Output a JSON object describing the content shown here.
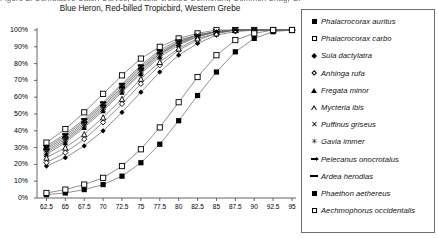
{
  "title": {
    "line1": "Figure 2. Cumulative Catch Curves, Double-crested Cormorant, Common Shag, Great White Pelican, Great",
    "line2": "Blue Heron, Red-billed Tropicbird, Western Grebe"
  },
  "legend": {
    "items": [
      {
        "marker": "filled-square",
        "label": "Phalacrocorax auritus"
      },
      {
        "marker": "open-square",
        "label": "Phalacrocorax carbo"
      },
      {
        "marker": "filled-diamond",
        "label": "Sula dactylatra"
      },
      {
        "marker": "open-diamond",
        "label": "Anhinga rufa"
      },
      {
        "marker": "filled-triangle",
        "label": "Fregata minor"
      },
      {
        "marker": "open-triangle",
        "label": "Mycteria ibis"
      },
      {
        "marker": "cross-x",
        "label": "Puffinus griseus"
      },
      {
        "marker": "asterisk",
        "label": "Gavia immer"
      },
      {
        "marker": "dash-arrow",
        "label": "Pelecanus onocrotalus"
      },
      {
        "marker": "dash",
        "label": "Ardea herodias"
      },
      {
        "marker": "filled-square",
        "label": "Phaethon aethereus"
      },
      {
        "marker": "open-square",
        "label": "Aechmophorus occidentalis"
      }
    ]
  },
  "chart_data": {
    "type": "line",
    "title": "Figure 2. Cumulative Catch Curves, Double-crested Cormorant, Common Shag, Great White Pelican, Great Blue Heron, Red-billed Tropicbird, Western Grebe",
    "xlabel": "",
    "ylabel": "",
    "grid": false,
    "legend_position": "right",
    "xlim": [
      61.25,
      95
    ],
    "ylim": [
      0,
      100
    ],
    "x": [
      62.5,
      65,
      67.5,
      70,
      72.5,
      75,
      77.5,
      80,
      82.5,
      85,
      87.5,
      90,
      92.5,
      95
    ],
    "xticks": [
      "62.5",
      "65",
      "67.5",
      "70",
      "72.5",
      "75",
      "77.5",
      "80",
      "82.5",
      "85",
      "87.5",
      "90",
      "92.5",
      "95"
    ],
    "yticks": [
      "0%",
      "10%",
      "20%",
      "30%",
      "40%",
      "50%",
      "60%",
      "70%",
      "80%",
      "90%",
      "100%"
    ],
    "series": [
      {
        "name": "Phalacrocorax auritus",
        "marker": "filled-square",
        "values": [
          30,
          37,
          46,
          56,
          67,
          78,
          87,
          93,
          97,
          99,
          100,
          100,
          100,
          100
        ]
      },
      {
        "name": "Phalacrocorax carbo",
        "marker": "open-square",
        "values": [
          33,
          41,
          51,
          62,
          73,
          83,
          90,
          95,
          98,
          100,
          100,
          100,
          100,
          100
        ]
      },
      {
        "name": "Sula dactylatra",
        "marker": "filled-diamond",
        "values": [
          19,
          24,
          31,
          40,
          51,
          63,
          75,
          85,
          92,
          97,
          99,
          100,
          100,
          100
        ]
      },
      {
        "name": "Anhinga rufa",
        "marker": "open-diamond",
        "values": [
          21,
          27,
          35,
          45,
          56,
          68,
          79,
          88,
          94,
          98,
          100,
          100,
          100,
          100
        ]
      },
      {
        "name": "Fregata minor",
        "marker": "filled-triangle",
        "values": [
          26,
          33,
          42,
          52,
          63,
          74,
          84,
          91,
          96,
          99,
          100,
          100,
          100,
          100
        ]
      },
      {
        "name": "Mycteria ibis",
        "marker": "open-triangle",
        "values": [
          24,
          30,
          38,
          48,
          59,
          71,
          81,
          89,
          95,
          98,
          100,
          100,
          100,
          100
        ]
      },
      {
        "name": "Puffinus griseus",
        "marker": "cross-x",
        "values": [
          27,
          34,
          43,
          53,
          64,
          75,
          85,
          92,
          96,
          99,
          100,
          100,
          100,
          100
        ]
      },
      {
        "name": "Gavia immer",
        "marker": "asterisk",
        "values": [
          28,
          35,
          44,
          54,
          65,
          76,
          86,
          92,
          97,
          99,
          100,
          100,
          100,
          100
        ]
      },
      {
        "name": "Pelecanus onocrotalus",
        "marker": "dash-arrow",
        "values": [
          29,
          36,
          45,
          55,
          66,
          77,
          86,
          93,
          97,
          99,
          100,
          100,
          100,
          100
        ]
      },
      {
        "name": "Ardea herodias",
        "marker": "dash",
        "values": [
          31,
          38,
          47,
          57,
          68,
          79,
          88,
          94,
          97,
          99,
          100,
          100,
          100,
          100
        ]
      },
      {
        "name": "Phaethon aethereus",
        "marker": "filled-square",
        "values": [
          2,
          3,
          5,
          8,
          13,
          21,
          32,
          46,
          61,
          75,
          87,
          95,
          99,
          100
        ]
      },
      {
        "name": "Aechmophorus occidentalis",
        "marker": "open-square",
        "values": [
          3,
          5,
          8,
          12,
          19,
          29,
          42,
          57,
          72,
          85,
          94,
          98,
          100,
          100
        ]
      }
    ]
  }
}
